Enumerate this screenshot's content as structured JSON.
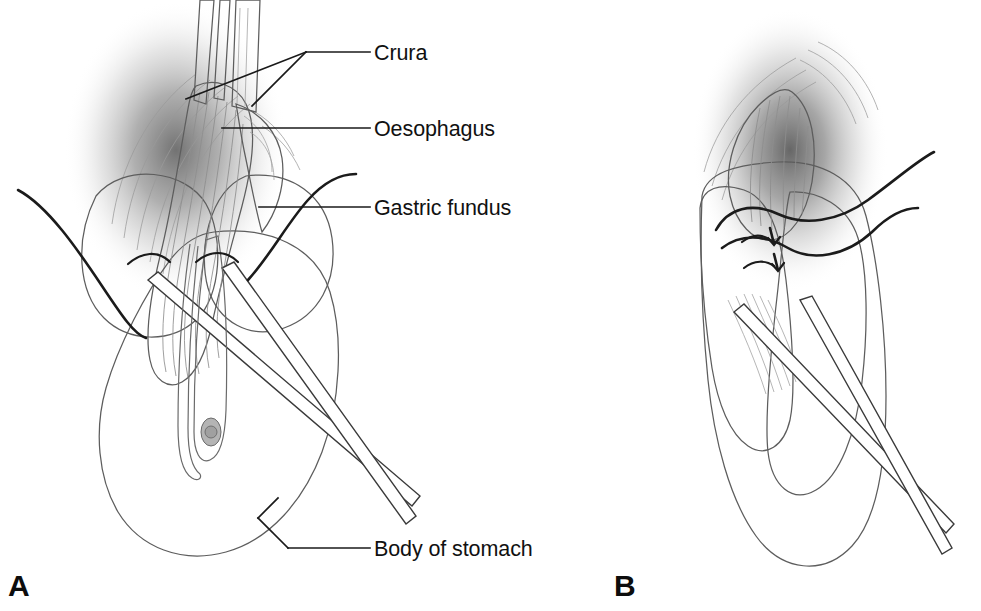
{
  "figure": {
    "background_color": "#ffffff",
    "width": 981,
    "height": 611
  },
  "panels": [
    {
      "id": "panel-a",
      "letter": "A",
      "letter_x": 8,
      "letter_y": 596,
      "description": "Gastric fundus drawn behind the oesophagus with graspers and crura exposed"
    },
    {
      "id": "panel-b",
      "letter": "B",
      "letter_x": 614,
      "letter_y": 596,
      "description": "Completed fundal wrap secured with two sutures"
    }
  ],
  "callouts": [
    {
      "id": "callout-crura",
      "label": "Crura",
      "text_x": 374,
      "text_y": 60,
      "leader_main": "M 370 52 L 306 52",
      "leader_fork_a": "M 306 52 L 186 99",
      "leader_fork_b": "M 306 52 L 252 106"
    },
    {
      "id": "callout-oesophagus",
      "label": "Oesophagus",
      "text_x": 374,
      "text_y": 136,
      "leader_main": "M 370 128 L 222 128"
    },
    {
      "id": "callout-gastric-fundus",
      "label": "Gastric fundus",
      "text_x": 374,
      "text_y": 215,
      "leader_main": "M 370 207 L 259 207"
    },
    {
      "id": "callout-body-of-stomach",
      "label": "Body of stomach",
      "text_x": 374,
      "text_y": 556,
      "leader_main": "M 370 548 L 288 548",
      "leader_elbow": "M 288 548 L 258 518",
      "leader_tail": "M 258 518 L 278 498"
    }
  ],
  "colors": {
    "organ_fill_light": "#eeeeee",
    "organ_fill_mid": "#e2e2e2",
    "organ_outline": "#5d5d5d",
    "shadow": "#5a5a5a",
    "ink": "#1a1a1a",
    "instrument_fill": "#ffffff",
    "striation": "#8e8e8e"
  },
  "anatomy_labels": {
    "crura": "Crura",
    "oesophagus": "Oesophagus",
    "gastric_fundus": "Gastric fundus",
    "body_of_stomach": "Body of stomach"
  }
}
